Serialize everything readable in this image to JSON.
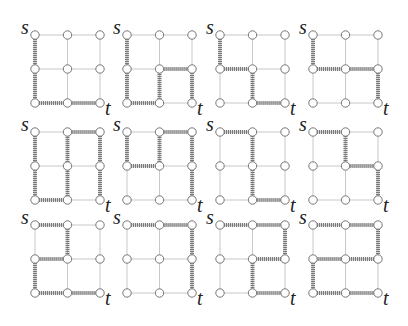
{
  "diagram": {
    "grid_size": 3,
    "source_label": "s",
    "target_label": "t",
    "colors": {
      "grid_edge": "#c8c8c8",
      "path_edge": "#7a7a7a",
      "node_fill": "#ffffff",
      "node_stroke": "#777777"
    },
    "layout": {
      "col_origins": [
        35,
        127,
        220,
        313
      ],
      "row_origins": [
        35,
        132,
        225
      ],
      "spacing_x": 32.5,
      "spacing_y": 34
    },
    "paths": [
      [
        [
          0,
          0
        ],
        [
          0,
          1
        ],
        [
          0,
          2
        ],
        [
          1,
          2
        ],
        [
          2,
          2
        ]
      ],
      [
        [
          0,
          0
        ],
        [
          0,
          1
        ],
        [
          0,
          2
        ],
        [
          1,
          2
        ],
        [
          1,
          1
        ],
        [
          2,
          1
        ],
        [
          2,
          2
        ]
      ],
      [
        [
          0,
          0
        ],
        [
          0,
          1
        ],
        [
          1,
          1
        ],
        [
          1,
          2
        ],
        [
          2,
          2
        ]
      ],
      [
        [
          0,
          0
        ],
        [
          0,
          1
        ],
        [
          1,
          1
        ],
        [
          2,
          1
        ],
        [
          2,
          2
        ]
      ],
      [
        [
          0,
          0
        ],
        [
          0,
          1
        ],
        [
          0,
          2
        ],
        [
          1,
          2
        ],
        [
          1,
          1
        ],
        [
          1,
          0
        ],
        [
          2,
          0
        ],
        [
          2,
          1
        ],
        [
          2,
          2
        ]
      ],
      [
        [
          0,
          0
        ],
        [
          0,
          1
        ],
        [
          1,
          1
        ],
        [
          1,
          0
        ],
        [
          2,
          0
        ],
        [
          2,
          1
        ],
        [
          2,
          2
        ]
      ],
      [
        [
          0,
          0
        ],
        [
          1,
          0
        ],
        [
          1,
          1
        ],
        [
          1,
          2
        ],
        [
          2,
          2
        ]
      ],
      [
        [
          0,
          0
        ],
        [
          1,
          0
        ],
        [
          1,
          1
        ],
        [
          2,
          1
        ],
        [
          2,
          2
        ]
      ],
      [
        [
          0,
          0
        ],
        [
          1,
          0
        ],
        [
          1,
          1
        ],
        [
          0,
          1
        ],
        [
          0,
          2
        ],
        [
          1,
          2
        ],
        [
          2,
          2
        ]
      ],
      [
        [
          0,
          0
        ],
        [
          1,
          0
        ],
        [
          2,
          0
        ],
        [
          2,
          1
        ],
        [
          2,
          2
        ]
      ],
      [
        [
          0,
          0
        ],
        [
          1,
          0
        ],
        [
          2,
          0
        ],
        [
          2,
          1
        ],
        [
          1,
          1
        ],
        [
          1,
          2
        ],
        [
          2,
          2
        ]
      ],
      [
        [
          0,
          0
        ],
        [
          1,
          0
        ],
        [
          2,
          0
        ],
        [
          2,
          1
        ],
        [
          1,
          1
        ],
        [
          0,
          1
        ],
        [
          0,
          2
        ],
        [
          1,
          2
        ],
        [
          2,
          2
        ]
      ]
    ]
  }
}
